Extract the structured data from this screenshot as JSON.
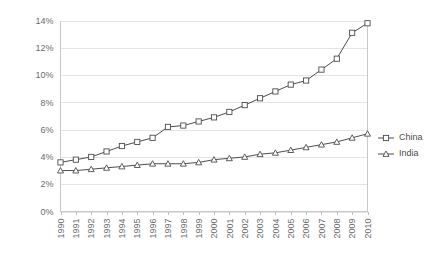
{
  "chart_data": {
    "type": "line",
    "title": "",
    "subtitle": "",
    "xlabel": "",
    "ylabel": "",
    "x": [
      1990,
      1991,
      1992,
      1993,
      1994,
      1995,
      1996,
      1997,
      1998,
      1999,
      2000,
      2001,
      2002,
      2003,
      2004,
      2005,
      2006,
      2007,
      2008,
      2009,
      2010
    ],
    "categories": [
      "1990",
      "1991",
      "1992",
      "1993",
      "1994",
      "1995",
      "1996",
      "1997",
      "1998",
      "1999",
      "2000",
      "2001",
      "2002",
      "2003",
      "2004",
      "2005",
      "2006",
      "2007",
      "2008",
      "2009",
      "2010"
    ],
    "series": [
      {
        "name": "China",
        "marker": "square",
        "color": "#4d4d4d",
        "values": [
          3.6,
          3.8,
          4.0,
          4.4,
          4.8,
          5.1,
          5.4,
          6.2,
          6.3,
          6.6,
          6.9,
          7.3,
          7.8,
          8.3,
          8.8,
          9.3,
          9.6,
          10.4,
          11.2,
          13.1,
          13.8
        ]
      },
      {
        "name": "India",
        "marker": "triangle",
        "color": "#4d4d4d",
        "values": [
          3.0,
          3.0,
          3.1,
          3.2,
          3.3,
          3.4,
          3.5,
          3.5,
          3.5,
          3.6,
          3.8,
          3.9,
          4.0,
          4.2,
          4.3,
          4.5,
          4.7,
          4.9,
          5.1,
          5.4,
          5.7
        ]
      }
    ],
    "ylim": [
      0,
      14
    ],
    "yticks": [
      0,
      2,
      4,
      6,
      8,
      10,
      12,
      14
    ],
    "ytick_labels": [
      "0%",
      "2%",
      "4%",
      "6%",
      "8%",
      "10%",
      "12%",
      "14%"
    ],
    "grid": true,
    "grid_axis": "y",
    "legend_position": "right",
    "legend_entries": [
      "China",
      "India"
    ],
    "background_color": "#ffffff",
    "gridline_color": "#e4e4e4",
    "axis_color": "#c9c9c9",
    "text_color": "#6b6b6b"
  }
}
